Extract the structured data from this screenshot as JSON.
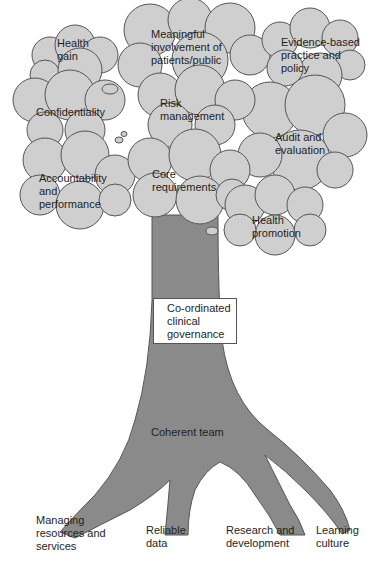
{
  "diagram": {
    "colors": {
      "cloud_fill": "#cfcfcf",
      "cloud_stroke": "#555555",
      "trunk_fill": "#8a8a8a",
      "background": "#ffffff",
      "box_fill": "#ffffff"
    },
    "canopy": [
      {
        "id": "health-gain",
        "lines": [
          "Health",
          "gain"
        ]
      },
      {
        "id": "meaningful-involvement",
        "lines": [
          "Meaningful",
          "involvement of",
          "patients/public"
        ]
      },
      {
        "id": "evidence-based",
        "lines": [
          "Evidence-based",
          "practice and",
          "policy"
        ]
      },
      {
        "id": "confidentiality",
        "lines": [
          "Confidentiality"
        ]
      },
      {
        "id": "risk-management",
        "lines": [
          "Risk",
          "management"
        ]
      },
      {
        "id": "audit-evaluation",
        "lines": [
          "Audit and",
          "evaluation"
        ]
      },
      {
        "id": "accountability",
        "lines": [
          "Accountability",
          "and",
          "performance"
        ]
      },
      {
        "id": "core-requirements",
        "lines": [
          "Core",
          "requirements"
        ]
      },
      {
        "id": "health-promotion",
        "lines": [
          "Health",
          "promotion"
        ]
      }
    ],
    "trunk": {
      "box_lines": [
        "Co-ordinated",
        "clinical",
        "governance"
      ],
      "base_label": "Coherent team"
    },
    "roots": [
      {
        "id": "managing-resources",
        "lines": [
          "Managing",
          "resources and",
          "services"
        ]
      },
      {
        "id": "reliable-data",
        "lines": [
          "Reliable",
          "data"
        ]
      },
      {
        "id": "research-development",
        "lines": [
          "Research and",
          "development"
        ]
      },
      {
        "id": "learning-culture",
        "lines": [
          "Learning",
          "culture"
        ]
      }
    ]
  }
}
